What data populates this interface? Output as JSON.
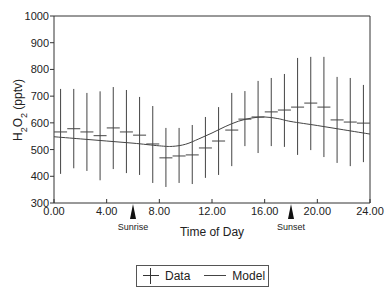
{
  "chart_data": {
    "type": "line",
    "title": "",
    "xlabel": "Time of Day",
    "ylabel": "H2O2 (pptv)",
    "ylabel_display": {
      "base": "H",
      "sub1": "2",
      "mid": "O",
      "sub2": "2",
      "unit": " (pptv)"
    },
    "xlim": [
      0,
      24
    ],
    "ylim": [
      300,
      1000
    ],
    "x_ticks": [
      0,
      4,
      8,
      12,
      16,
      20,
      24
    ],
    "x_tick_labels": [
      "0.00",
      "4.00",
      "8.00",
      "12.00",
      "16.00",
      "20.00",
      "24.00"
    ],
    "y_ticks": [
      300,
      400,
      500,
      600,
      700,
      800,
      900,
      1000
    ],
    "y_tick_labels": [
      "300",
      "400",
      "500",
      "600",
      "700",
      "800",
      "900",
      "1000"
    ],
    "grid": false,
    "legend_position": "bottom-center",
    "annotations": [
      {
        "label": "Sunrise",
        "x": 6.0
      },
      {
        "label": "Sunset",
        "x": 18.0
      }
    ],
    "series": [
      {
        "name": "Data",
        "style": "errorbar",
        "x": [
          0.5,
          1.5,
          2.5,
          3.5,
          4.5,
          5.5,
          6.5,
          7.5,
          8.5,
          9.5,
          10.5,
          11.5,
          12.5,
          13.5,
          14.5,
          15.5,
          16.5,
          17.5,
          18.5,
          19.5,
          20.5,
          21.5,
          22.5,
          23.5
        ],
        "values": [
          566,
          578,
          566,
          552,
          581,
          566,
          554,
          521,
          469,
          476,
          480,
          506,
          532,
          573,
          614,
          622,
          641,
          648,
          659,
          674,
          659,
          611,
          603,
          599
        ],
        "upper": [
          727,
          727,
          712,
          718,
          734,
          723,
          697,
          663,
          581,
          581,
          592,
          622,
          659,
          712,
          719,
          757,
          768,
          783,
          843,
          847,
          847,
          772,
          768,
          742
        ],
        "lower": [
          409,
          430,
          420,
          385,
          427,
          412,
          405,
          375,
          360,
          375,
          371,
          394,
          405,
          438,
          513,
          487,
          513,
          510,
          480,
          498,
          472,
          450,
          438,
          453
        ]
      },
      {
        "name": "Model",
        "style": "line",
        "x": [
          0,
          2,
          4,
          6,
          8,
          9,
          10,
          11,
          12,
          13,
          14,
          15,
          16,
          17,
          18,
          20,
          22,
          24
        ],
        "values": [
          548,
          540,
          532,
          524,
          514,
          512,
          520,
          540,
          562,
          586,
          606,
          618,
          622,
          616,
          605,
          590,
          574,
          558
        ]
      }
    ]
  },
  "legend": {
    "items": [
      {
        "label": "Data"
      },
      {
        "label": "Model"
      }
    ]
  }
}
